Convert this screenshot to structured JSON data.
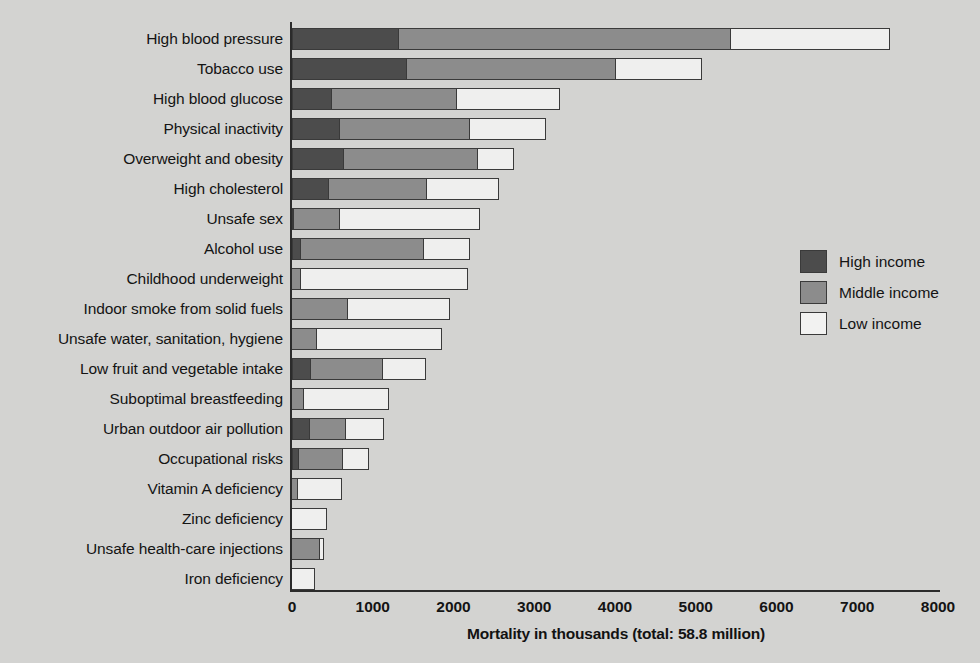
{
  "chart_data": {
    "type": "bar",
    "orientation": "horizontal",
    "stacked": true,
    "title": "",
    "xlabel": "Mortality in thousands (total: 58.8 million)",
    "ylabel": "",
    "xlim": [
      0,
      8000
    ],
    "xticks": [
      0,
      1000,
      2000,
      3000,
      4000,
      5000,
      6000,
      7000,
      8000
    ],
    "xtick_labels": [
      "0",
      "1000",
      "2000",
      "3000",
      "4000",
      "5000",
      "6000",
      "7000",
      "8000"
    ],
    "grid": false,
    "legend_position": "right",
    "legend": [
      "High income",
      "Middle income",
      "Low income"
    ],
    "categories": [
      "High blood pressure",
      "Tobacco use",
      "High blood glucose",
      "Physical inactivity",
      "Overweight and obesity",
      "High cholesterol",
      "Unsafe sex",
      "Alcohol use",
      "Childhood underweight",
      "Indoor smoke from solid fuels",
      "Unsafe water, sanitation, hygiene",
      "Low fruit and vegetable intake",
      "Suboptimal breastfeeding",
      "Urban outdoor air pollution",
      "Occupational risks",
      "Vitamin A deficiency",
      "Zinc deficiency",
      "Unsafe health-care injections",
      "Iron deficiency"
    ],
    "series": [
      {
        "name": "High income",
        "color": "#4c4c4c",
        "values": [
          1330,
          1430,
          500,
          600,
          650,
          460,
          30,
          110,
          0,
          0,
          0,
          230,
          0,
          220,
          90,
          0,
          0,
          0,
          0
        ]
      },
      {
        "name": "Middle income",
        "color": "#8c8c8c",
        "values": [
          4120,
          2600,
          1560,
          1620,
          1660,
          1230,
          580,
          1540,
          120,
          700,
          320,
          910,
          160,
          460,
          560,
          90,
          0,
          360,
          0
        ]
      },
      {
        "name": "Low income",
        "color": "#efefee",
        "values": [
          1980,
          1070,
          1280,
          950,
          470,
          900,
          1740,
          580,
          2080,
          1280,
          1560,
          540,
          1070,
          480,
          330,
          560,
          450,
          60,
          300
        ]
      }
    ],
    "totals": [
      7430,
      5100,
      3340,
      3170,
      2780,
      2590,
      2350,
      2230,
      2200,
      1980,
      1880,
      1680,
      1230,
      1160,
      980,
      650,
      450,
      420,
      300
    ]
  },
  "legend": {
    "items": [
      {
        "label": "High income",
        "color": "#4c4c4c"
      },
      {
        "label": "Middle income",
        "color": "#8c8c8c"
      },
      {
        "label": "Low income",
        "color": "#f2f2f1"
      }
    ]
  },
  "axis": {
    "x_title": "Mortality in thousands (total: 58.8 million)"
  }
}
